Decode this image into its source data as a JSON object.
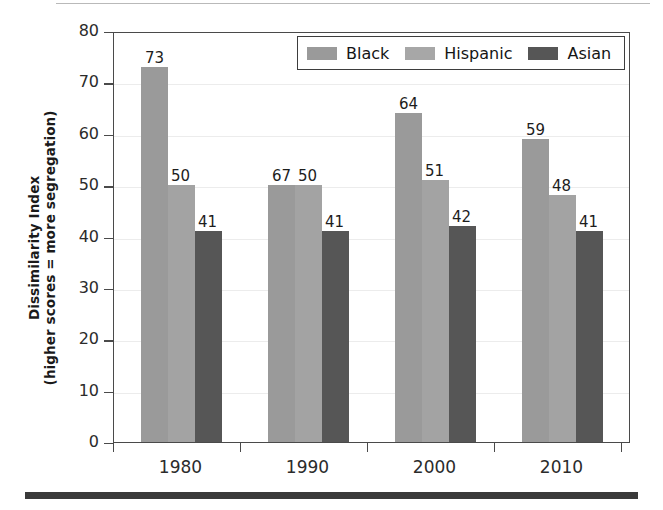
{
  "chart_data": {
    "type": "bar",
    "title": "",
    "xlabel": "",
    "ylabel": "Dissimilarity Index (higher scores = more segregation)",
    "ylabel_line1": "Dissimilarity Index",
    "ylabel_line2": "(higher scores = more segregation)",
    "categories": [
      "1980",
      "1990",
      "2000",
      "2010"
    ],
    "series": [
      {
        "name": "Black",
        "values": [
          73,
          50,
          64,
          59
        ],
        "color": "#9a9a9a"
      },
      {
        "name": "Hispanic",
        "values": [
          50,
          50,
          51,
          48
        ],
        "color": "#a3a3a3"
      },
      {
        "name": "Asian",
        "values": [
          41,
          41,
          42,
          41
        ],
        "color": "#565656"
      }
    ],
    "ylim": [
      0,
      80
    ],
    "ytick_values": [
      0,
      10,
      20,
      30,
      40,
      50,
      60,
      70,
      80
    ],
    "ytick_labels": [
      "0",
      "10",
      "20",
      "30",
      "40",
      "50",
      "60",
      "70",
      "80"
    ],
    "grid": true,
    "grid_axis": "y",
    "legend_position": "top-right-inside",
    "data_labels": true,
    "bar_labels": [
      [
        "73",
        "50",
        "41"
      ],
      [
        "67",
        "50",
        "41"
      ],
      [
        "64",
        "51",
        "42"
      ],
      [
        "59",
        "48",
        "41"
      ]
    ]
  },
  "legend": {
    "entries": [
      {
        "label": "Black",
        "color": "#9a9a9a"
      },
      {
        "label": "Hispanic",
        "color": "#a7a7a7"
      },
      {
        "label": "Asian",
        "color": "#565656"
      }
    ]
  },
  "axes": {
    "y_title_line1": "Dissimilarity Index",
    "y_title_line2": "(higher scores = more segregation)",
    "y_ticks": [
      "80",
      "70",
      "60",
      "50",
      "40",
      "30",
      "20",
      "10",
      "0"
    ],
    "x_ticks": [
      "1980",
      "1990",
      "2000",
      "2010"
    ]
  },
  "colors": {
    "black_series": "#9a9a9a",
    "hispanic_series": "#a3a3a3",
    "asian_series": "#565656",
    "frame": "#4a4a4a",
    "grid": "#ececec",
    "rule": "#3a3a3a"
  }
}
